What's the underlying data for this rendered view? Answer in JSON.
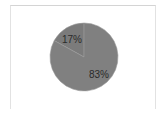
{
  "chart_data": {
    "type": "pie",
    "title": "",
    "categories": [
      "Slice A",
      "Slice B"
    ],
    "values": [
      17,
      83
    ],
    "labels": [
      "17%",
      "83%"
    ],
    "colors": [
      "#7b7b7b",
      "#808080"
    ],
    "legend": "none",
    "grid": false,
    "start_angle": "12 o'clock, 17% slice counterclockwise"
  }
}
